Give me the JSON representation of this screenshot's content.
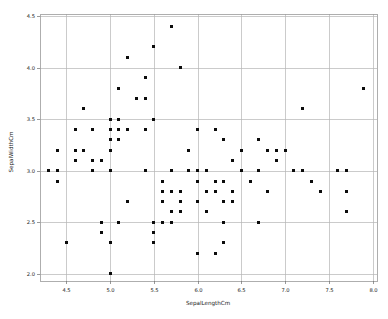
{
  "figure": {
    "background_color": "#ffffff",
    "plot_area": {
      "left": 40,
      "top": 14,
      "right": 377,
      "bottom": 281
    }
  },
  "chart_data": {
    "type": "scatter",
    "title": "",
    "xlabel": "SepalLengthCm",
    "ylabel": "SepalWidthCm",
    "xlim": [
      4.2,
      8.05
    ],
    "ylim": [
      1.93,
      4.52
    ],
    "xticks": [
      4.5,
      5.0,
      5.5,
      6.0,
      6.5,
      7.0,
      7.5,
      8.0
    ],
    "xtick_labels": [
      "4.5",
      "5.0",
      "5.5",
      "6.0",
      "6.5",
      "7.0",
      "7.5",
      "8.0"
    ],
    "yticks": [
      2.0,
      2.5,
      3.0,
      3.5,
      4.0,
      4.5
    ],
    "ytick_labels": [
      "2.0",
      "2.5",
      "3.0",
      "3.5",
      "4.0",
      "4.5"
    ],
    "grid": true,
    "grid_color": "#b5b5b5",
    "legend": false,
    "marker": {
      "shape": "square",
      "size_px": 3,
      "color": "#0c0c0c"
    },
    "x": [
      4.3,
      4.4,
      4.4,
      4.4,
      4.5,
      4.6,
      4.6,
      4.6,
      4.7,
      4.7,
      4.8,
      4.8,
      4.8,
      4.9,
      4.9,
      4.9,
      5.0,
      5.0,
      5.0,
      5.0,
      5.0,
      5.0,
      5.0,
      5.1,
      5.1,
      5.1,
      5.1,
      5.1,
      5.2,
      5.2,
      5.2,
      5.3,
      5.4,
      5.4,
      5.4,
      5.4,
      5.5,
      5.5,
      5.5,
      5.5,
      5.5,
      5.6,
      5.6,
      5.6,
      5.6,
      5.7,
      5.7,
      5.7,
      5.7,
      5.7,
      5.8,
      5.8,
      5.8,
      5.8,
      5.8,
      5.9,
      5.9,
      6.0,
      6.0,
      6.0,
      6.0,
      6.0,
      6.1,
      6.1,
      6.1,
      6.2,
      6.2,
      6.2,
      6.2,
      6.3,
      6.3,
      6.3,
      6.3,
      6.3,
      6.4,
      6.4,
      6.4,
      6.5,
      6.5,
      6.6,
      6.7,
      6.7,
      6.7,
      6.8,
      6.8,
      6.9,
      6.9,
      7.0,
      7.1,
      7.2,
      7.2,
      7.3,
      7.4,
      7.6,
      7.7,
      7.7,
      7.7,
      7.9
    ],
    "y": [
      3.0,
      2.9,
      3.0,
      3.2,
      2.3,
      3.1,
      3.2,
      3.4,
      3.2,
      3.6,
      3.0,
      3.1,
      3.4,
      2.4,
      2.5,
      3.1,
      2.0,
      2.3,
      3.0,
      3.2,
      3.3,
      3.4,
      3.5,
      2.5,
      3.3,
      3.4,
      3.5,
      3.8,
      2.7,
      3.4,
      4.1,
      3.7,
      3.0,
      3.4,
      3.7,
      3.9,
      2.3,
      2.4,
      2.5,
      3.5,
      4.2,
      2.5,
      2.7,
      2.8,
      2.9,
      2.5,
      2.6,
      2.8,
      3.0,
      4.4,
      2.6,
      2.7,
      2.7,
      2.8,
      4.0,
      3.0,
      3.2,
      2.2,
      2.7,
      2.9,
      3.0,
      3.4,
      2.6,
      2.8,
      3.0,
      2.2,
      2.8,
      2.9,
      3.4,
      2.3,
      2.5,
      2.7,
      2.9,
      3.3,
      2.7,
      2.8,
      3.1,
      3.0,
      3.2,
      2.9,
      2.5,
      3.0,
      3.3,
      2.8,
      3.2,
      3.1,
      3.2,
      3.2,
      3.0,
      3.0,
      3.6,
      2.9,
      2.8,
      3.0,
      2.6,
      2.8,
      3.0,
      3.8
    ]
  }
}
